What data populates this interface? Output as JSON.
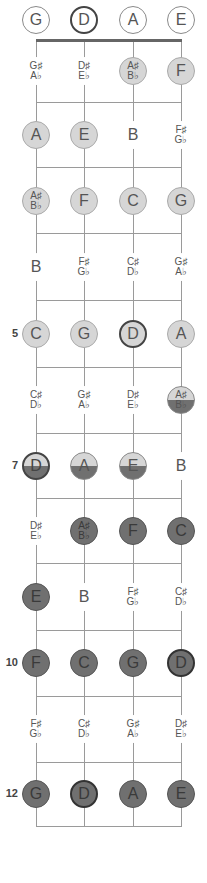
{
  "strings": [
    "G",
    "D",
    "A",
    "E"
  ],
  "string_x": [
    36,
    84,
    133,
    181
  ],
  "row_y": [
    20,
    71,
    135,
    201,
    267,
    334,
    400,
    466,
    531,
    597,
    663,
    729,
    794
  ],
  "fret_y": [
    102,
    167,
    233,
    300,
    367,
    433,
    498,
    563,
    630,
    696,
    762,
    826
  ],
  "nut_y": 39,
  "fret_numbers": [
    {
      "fret": 5,
      "label": "5"
    },
    {
      "fret": 7,
      "label": "7"
    },
    {
      "fret": 10,
      "label": "10"
    },
    {
      "fret": 12,
      "label": "12"
    }
  ],
  "colors": {
    "light_fill": "#d6d6d6",
    "dark_fill": "#707070",
    "line": "#9a9a9a",
    "nut": "#666666",
    "text": "#555555"
  },
  "rows": [
    [
      {
        "n": "G",
        "s": "open"
      },
      {
        "n": "D",
        "s": "open-strong"
      },
      {
        "n": "A",
        "s": "open"
      },
      {
        "n": "E",
        "s": "open"
      }
    ],
    [
      {
        "n": "G♯",
        "f": "A♭",
        "s": "bare"
      },
      {
        "n": "D♯",
        "f": "E♭",
        "s": "bare"
      },
      {
        "n": "A♯",
        "f": "B♭",
        "s": "light"
      },
      {
        "n": "F",
        "s": "light"
      }
    ],
    [
      {
        "n": "A",
        "s": "light"
      },
      {
        "n": "E",
        "s": "light"
      },
      {
        "n": "B",
        "s": "bare"
      },
      {
        "n": "F♯",
        "f": "G♭",
        "s": "bare"
      }
    ],
    [
      {
        "n": "A♯",
        "f": "B♭",
        "s": "light"
      },
      {
        "n": "F",
        "s": "light"
      },
      {
        "n": "C",
        "s": "light"
      },
      {
        "n": "G",
        "s": "light"
      }
    ],
    [
      {
        "n": "B",
        "s": "bare"
      },
      {
        "n": "F♯",
        "f": "G♭",
        "s": "bare"
      },
      {
        "n": "C♯",
        "f": "D♭",
        "s": "bare"
      },
      {
        "n": "G♯",
        "f": "A♭",
        "s": "bare"
      }
    ],
    [
      {
        "n": "C",
        "s": "light"
      },
      {
        "n": "G",
        "s": "light"
      },
      {
        "n": "D",
        "s": "light-strong"
      },
      {
        "n": "A",
        "s": "light"
      }
    ],
    [
      {
        "n": "C♯",
        "f": "D♭",
        "s": "bare"
      },
      {
        "n": "G♯",
        "f": "A♭",
        "s": "bare"
      },
      {
        "n": "D♯",
        "f": "E♭",
        "s": "bare"
      },
      {
        "n": "A♯",
        "f": "B♭",
        "s": "half"
      }
    ],
    [
      {
        "n": "D",
        "s": "half-strong"
      },
      {
        "n": "A",
        "s": "half"
      },
      {
        "n": "E",
        "s": "half"
      },
      {
        "n": "B",
        "s": "bare"
      }
    ],
    [
      {
        "n": "D♯",
        "f": "E♭",
        "s": "bare"
      },
      {
        "n": "A♯",
        "f": "B♭",
        "s": "dark"
      },
      {
        "n": "F",
        "s": "dark"
      },
      {
        "n": "C",
        "s": "dark"
      }
    ],
    [
      {
        "n": "E",
        "s": "dark"
      },
      {
        "n": "B",
        "s": "bare"
      },
      {
        "n": "F♯",
        "f": "G♭",
        "s": "bare"
      },
      {
        "n": "C♯",
        "f": "D♭",
        "s": "bare"
      }
    ],
    [
      {
        "n": "F",
        "s": "dark"
      },
      {
        "n": "C",
        "s": "dark"
      },
      {
        "n": "G",
        "s": "dark"
      },
      {
        "n": "D",
        "s": "dark-strong"
      }
    ],
    [
      {
        "n": "F♯",
        "f": "G♭",
        "s": "bare"
      },
      {
        "n": "C♯",
        "f": "D♭",
        "s": "bare"
      },
      {
        "n": "G♯",
        "f": "A♭",
        "s": "bare"
      },
      {
        "n": "D♯",
        "f": "E♭",
        "s": "bare"
      }
    ],
    [
      {
        "n": "G",
        "s": "dark"
      },
      {
        "n": "D",
        "s": "dark-strong"
      },
      {
        "n": "A",
        "s": "dark"
      },
      {
        "n": "E",
        "s": "dark"
      }
    ]
  ]
}
